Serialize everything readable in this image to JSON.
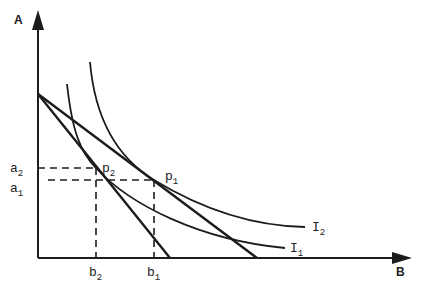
{
  "diagram": {
    "axes": {
      "y_label": "A",
      "x_label": "B"
    },
    "curves": [
      {
        "id": "I1",
        "label": "I",
        "subscript": "1"
      },
      {
        "id": "I2",
        "label": "I",
        "subscript": "2"
      }
    ],
    "points": [
      {
        "id": "p1",
        "label": "p",
        "subscript": "1"
      },
      {
        "id": "p2",
        "label": "p",
        "subscript": "2"
      }
    ],
    "y_ticks": [
      {
        "id": "a2",
        "label": "a",
        "subscript": "2"
      },
      {
        "id": "a1",
        "label": "a",
        "subscript": "1"
      }
    ],
    "x_ticks": [
      {
        "id": "b2",
        "label": "b",
        "subscript": "2"
      },
      {
        "id": "b1",
        "label": "b",
        "subscript": "1"
      }
    ],
    "budget_lines": [
      {
        "id": "steep",
        "description": "budget line from A-intercept to b near 170"
      },
      {
        "id": "flat",
        "description": "budget line from A-intercept to b near 257"
      }
    ]
  }
}
